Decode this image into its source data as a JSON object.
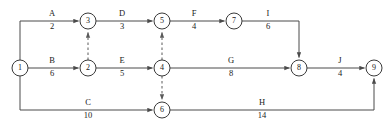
{
  "diagram": {
    "type": "activity-on-arrow-network",
    "colors": {
      "background": "#ffffff",
      "line": "#4a4a4a",
      "node_stroke": "#3a3a3a",
      "text": "#1a1a1a",
      "dashed_line": "#5a5a5a"
    },
    "nodes": [
      {
        "id": "1",
        "label": "1",
        "x": 20,
        "y": 68,
        "r": 8
      },
      {
        "id": "2",
        "label": "2",
        "x": 88,
        "y": 68,
        "r": 8
      },
      {
        "id": "3",
        "label": "3",
        "x": 88,
        "y": 21,
        "r": 8
      },
      {
        "id": "4",
        "label": "4",
        "x": 162,
        "y": 68,
        "r": 8
      },
      {
        "id": "5",
        "label": "5",
        "x": 162,
        "y": 21,
        "r": 8
      },
      {
        "id": "6",
        "label": "6",
        "x": 162,
        "y": 110,
        "r": 8
      },
      {
        "id": "7",
        "label": "7",
        "x": 234,
        "y": 21,
        "r": 8
      },
      {
        "id": "8",
        "label": "8",
        "x": 299,
        "y": 68,
        "r": 8
      },
      {
        "id": "9",
        "label": "9",
        "x": 374,
        "y": 68,
        "r": 8
      }
    ],
    "edges": [
      {
        "id": "A",
        "name": "A",
        "weight": "2",
        "from": "1",
        "to": "3",
        "label_x": 52,
        "name_y": 16,
        "weight_y": 29,
        "dashed": false
      },
      {
        "id": "B",
        "name": "B",
        "weight": "6",
        "from": "1",
        "to": "2",
        "label_x": 52,
        "name_y": 63,
        "weight_y": 76,
        "dashed": false
      },
      {
        "id": "C",
        "name": "C",
        "weight": "10",
        "from": "1",
        "to": "6",
        "label_x": 88,
        "name_y": 105,
        "weight_y": 118,
        "dashed": false
      },
      {
        "id": "D",
        "name": "D",
        "weight": "3",
        "from": "3",
        "to": "5",
        "label_x": 122,
        "name_y": 16,
        "weight_y": 29,
        "dashed": false
      },
      {
        "id": "E",
        "name": "E",
        "weight": "5",
        "from": "2",
        "to": "4",
        "label_x": 122,
        "name_y": 63,
        "weight_y": 76,
        "dashed": false
      },
      {
        "id": "F",
        "name": "F",
        "weight": "4",
        "from": "5",
        "to": "7",
        "label_x": 194,
        "name_y": 16,
        "weight_y": 29,
        "dashed": false
      },
      {
        "id": "G",
        "name": "G",
        "weight": "8",
        "from": "4",
        "to": "8",
        "label_x": 231,
        "name_y": 63,
        "weight_y": 76,
        "dashed": false
      },
      {
        "id": "H",
        "name": "H",
        "weight": "14",
        "from": "6",
        "to": "9",
        "label_x": 262,
        "name_y": 105,
        "weight_y": 118,
        "dashed": false
      },
      {
        "id": "I",
        "name": "I",
        "weight": "6",
        "from": "7",
        "to": "8",
        "label_x": 268,
        "name_y": 16,
        "weight_y": 29,
        "dashed": false
      },
      {
        "id": "J",
        "name": "J",
        "weight": "4",
        "from": "8",
        "to": "9",
        "label_x": 340,
        "name_y": 63,
        "weight_y": 76,
        "dashed": false
      }
    ],
    "dummy_edges": [
      {
        "id": "dummy-2-3",
        "from": "2",
        "to": "3",
        "dashed": true
      },
      {
        "id": "dummy-4-5",
        "from": "4",
        "to": "5",
        "dashed": true
      },
      {
        "id": "dummy-4-6",
        "from": "4",
        "to": "6",
        "dashed": true
      }
    ]
  }
}
